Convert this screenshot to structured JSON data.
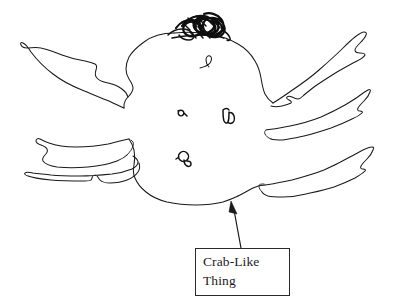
{
  "canvas": {
    "width": 409,
    "height": 307,
    "background_color": "#ffffff",
    "ink_color": "#1a1a1a"
  },
  "figure": {
    "kind": "hand-drawn-sketch",
    "parts": [
      {
        "name": "body",
        "label": "central body outline"
      },
      {
        "name": "scribble-mass",
        "label": "dark scribbled mass on top of body"
      },
      {
        "name": "leg-upper-left",
        "label": "upper left appendage"
      },
      {
        "name": "leg-middle-left",
        "label": "middle left appendage"
      },
      {
        "name": "leg-lower-left",
        "label": "lower left appendage"
      },
      {
        "name": "leg-upper-right",
        "label": "upper right appendage"
      },
      {
        "name": "leg-middle-right",
        "label": "middle right appendage"
      },
      {
        "name": "leg-lower-right",
        "label": "lower right appendage"
      },
      {
        "name": "hook-squiggle",
        "label": "small hook mark inside body"
      },
      {
        "name": "interior-mark-left",
        "label": "small mark inside body, left"
      },
      {
        "name": "interior-mark-right",
        "label": "small mark inside body, right"
      },
      {
        "name": "interior-mark-bottom",
        "label": "small mark inside body, bottom"
      }
    ]
  },
  "callout": {
    "line1": "Crab-Like",
    "line2": "Thing",
    "border_color": "#2a2a2a",
    "text_color": "#1c1c1c",
    "box": {
      "x": 195,
      "y": 248,
      "width": 95,
      "height": 48
    },
    "arrow": {
      "from": {
        "x": 241,
        "y": 248
      },
      "to": {
        "x": 232,
        "y": 202
      },
      "points_to": "body"
    }
  }
}
